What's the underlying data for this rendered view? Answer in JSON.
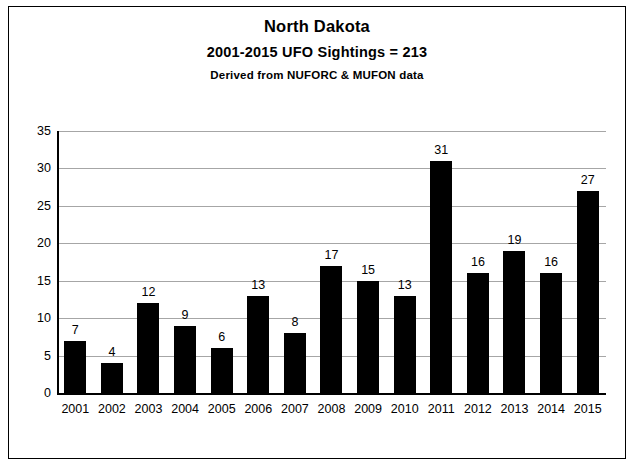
{
  "chart_data": {
    "type": "bar",
    "title": "North Dakota",
    "subtitle": "2001-2015  UFO Sightings = 213",
    "source": "Derived from NUFORC  & MUFON  data",
    "categories": [
      "2001",
      "2002",
      "2003",
      "2004",
      "2005",
      "2006",
      "2007",
      "2008",
      "2009",
      "2010",
      "2011",
      "2012",
      "2013",
      "2014",
      "2015"
    ],
    "values": [
      7,
      4,
      12,
      9,
      6,
      13,
      8,
      17,
      15,
      13,
      31,
      16,
      19,
      16,
      27
    ],
    "data_labels": [
      "7",
      "4",
      "12",
      "9",
      "6",
      "13",
      "8",
      "17",
      "15",
      "13",
      "31",
      "16",
      "19",
      "16",
      "27"
    ],
    "xlabel": "",
    "ylabel": "",
    "ylim": [
      0,
      35
    ],
    "yticks": [
      "0",
      "5",
      "10",
      "15",
      "20",
      "25",
      "30",
      "35"
    ],
    "grid": true,
    "legend": false,
    "bar_color": "#000000"
  }
}
